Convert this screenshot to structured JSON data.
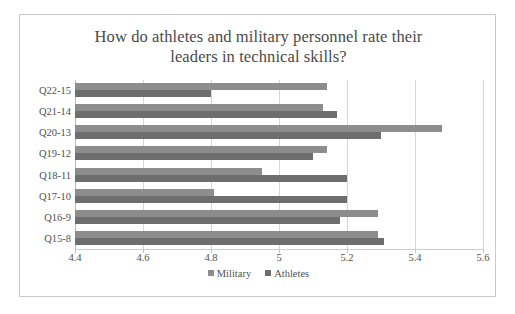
{
  "chart_data": {
    "type": "bar",
    "orientation": "horizontal",
    "title": "How do athletes and military personnel rate their leaders in technical skills?",
    "title_line1": "How do athletes and military personnel rate their",
    "title_line2": "leaders in technical skills?",
    "xlabel": "",
    "ylabel": "",
    "categories": [
      "Q22-15",
      "Q21-14",
      "Q20-13",
      "Q19-12",
      "Q18-11",
      "Q17-10",
      "Q16-9",
      "Q15-8"
    ],
    "series": [
      {
        "name": "Military",
        "color": "#8d8d8d",
        "values": [
          5.14,
          5.13,
          5.48,
          5.14,
          4.95,
          4.81,
          5.29,
          5.29
        ]
      },
      {
        "name": "Athletes",
        "color": "#6e6e6e",
        "values": [
          4.8,
          5.17,
          5.3,
          5.1,
          5.2,
          5.2,
          5.18,
          5.31
        ]
      }
    ],
    "xlim": [
      4.4,
      5.6
    ],
    "xticks": [
      4.4,
      4.6,
      4.8,
      5.0,
      5.2,
      5.4,
      5.6
    ],
    "xtick_labels": [
      "4.4",
      "4.6",
      "4.8",
      "5",
      "5.2",
      "5.4",
      "5.6"
    ],
    "grid": true,
    "grid_axis": "x",
    "legend_position": "bottom"
  },
  "colors": {
    "frame_border": "#c9c9c9",
    "gridline": "#d6d6d6",
    "text": "#4f4f4f",
    "title_text": "#4a4a4a",
    "background": "#ffffff"
  }
}
